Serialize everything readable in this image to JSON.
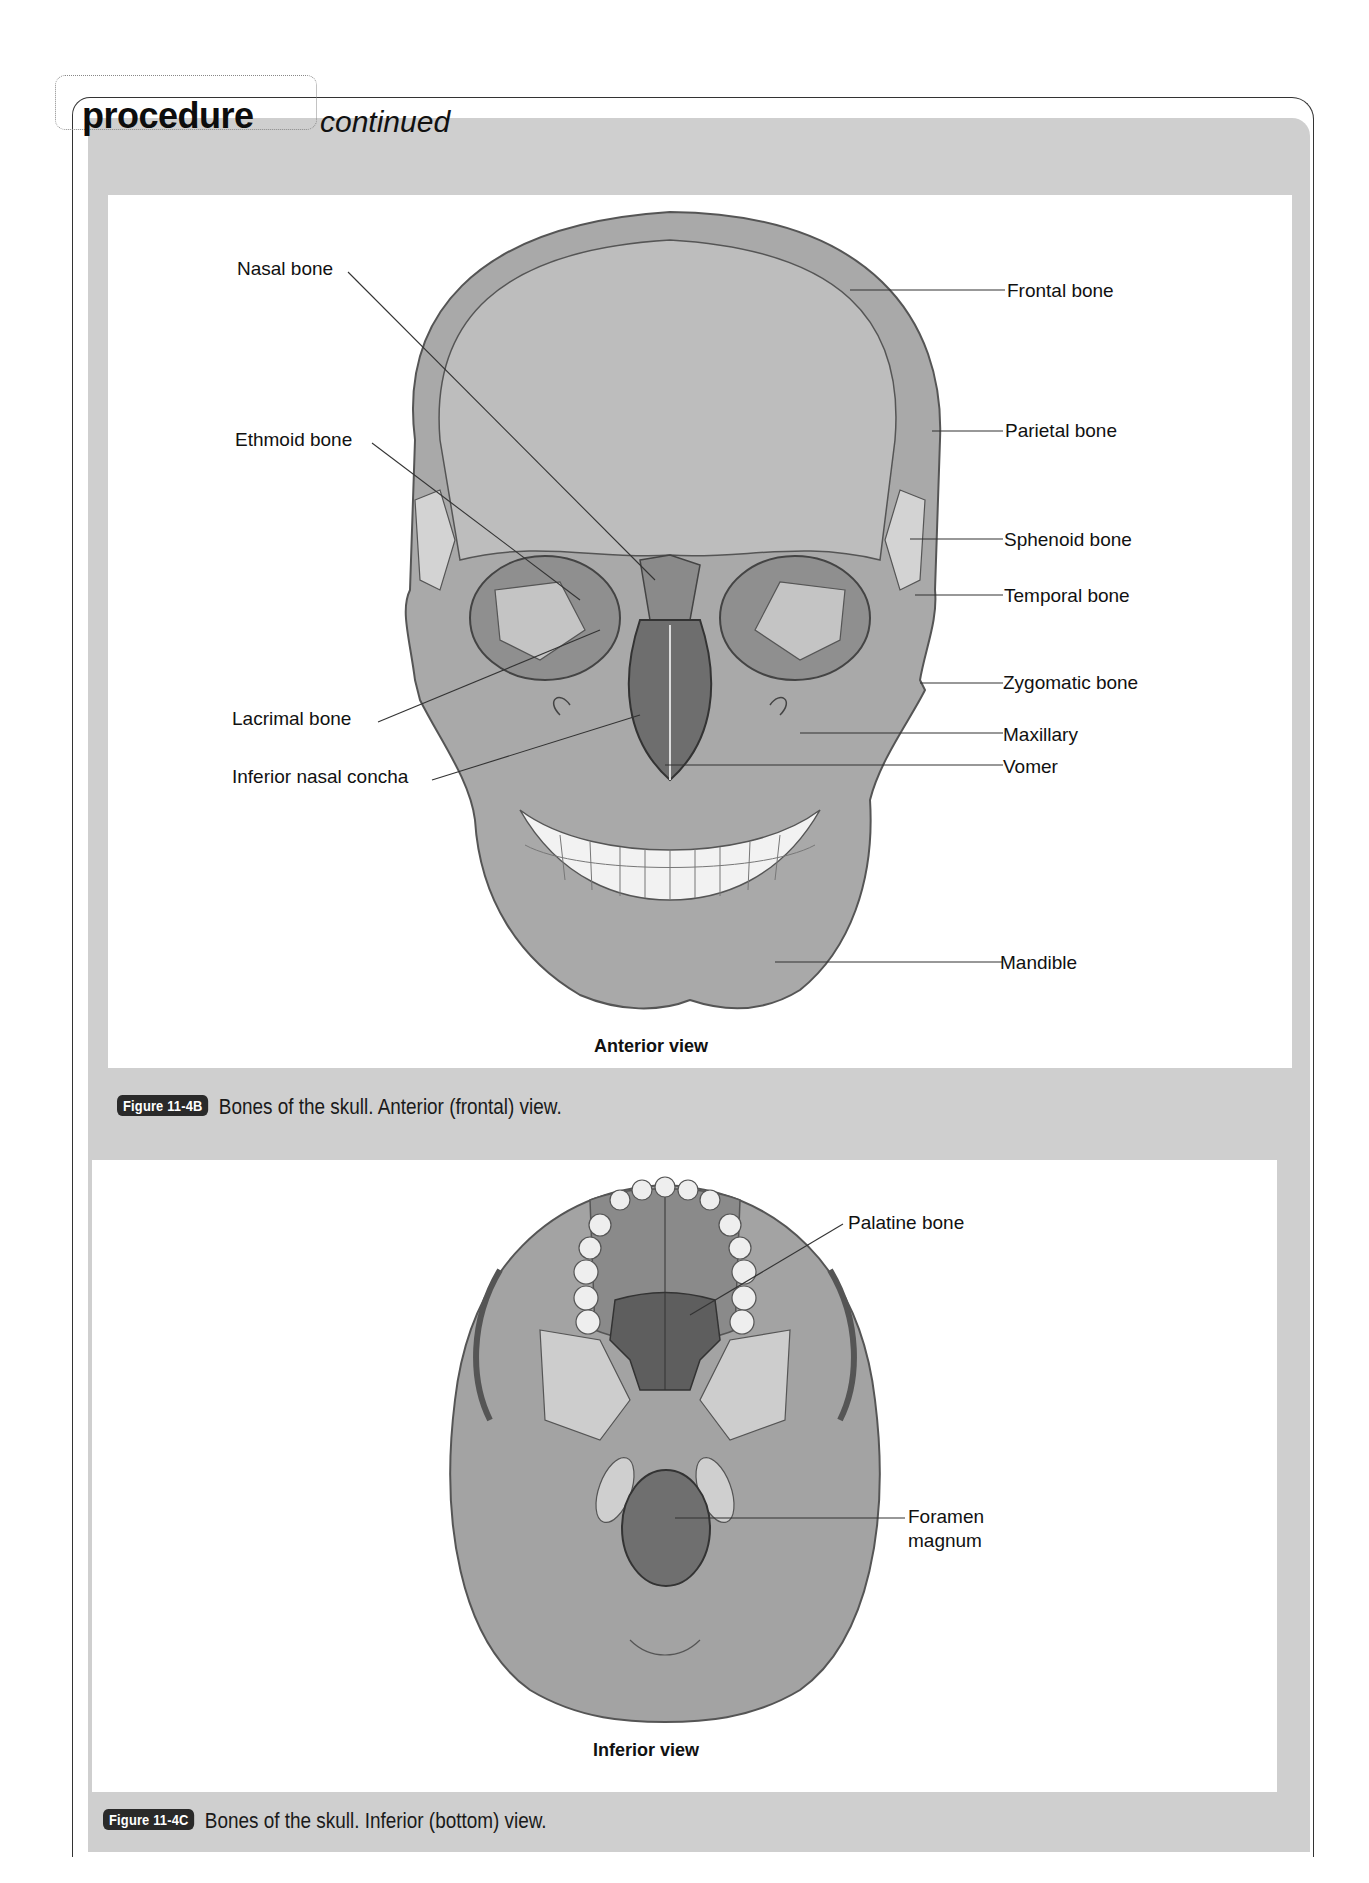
{
  "header": {
    "title": "procedure",
    "subtitle": "continued"
  },
  "figures": [
    {
      "view_title": "Anterior view",
      "badge": "Figure 11-4B",
      "caption": "Bones of the skull. Anterior (frontal) view.",
      "labels_left": [
        {
          "text": "Nasal bone"
        },
        {
          "text": "Ethmoid bone"
        },
        {
          "text": "Lacrimal bone"
        },
        {
          "text": "Inferior nasal concha"
        }
      ],
      "labels_right": [
        {
          "text": "Frontal bone"
        },
        {
          "text": "Parietal bone"
        },
        {
          "text": "Sphenoid bone"
        },
        {
          "text": "Temporal bone"
        },
        {
          "text": "Zygomatic bone"
        },
        {
          "text": "Maxillary"
        },
        {
          "text": "Vomer"
        },
        {
          "text": "Mandible"
        }
      ]
    },
    {
      "view_title": "Inferior view",
      "badge": "Figure 11-4C",
      "caption": "Bones of the skull. Inferior (bottom) view.",
      "labels_right": [
        {
          "text": "Palatine bone"
        },
        {
          "text": "Foramen"
        },
        {
          "text": "magnum"
        }
      ]
    }
  ],
  "colors": {
    "band_gray": "#cfcfcf",
    "bone_gray": "#a9a9a9",
    "bone_light": "#c8c8c8",
    "bone_dark": "#7d7d7d",
    "badge_bg": "#2a2a2a"
  }
}
